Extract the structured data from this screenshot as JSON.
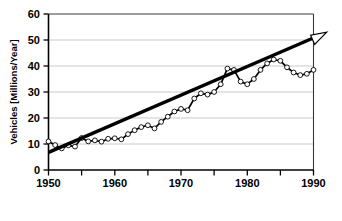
{
  "chart_data": {
    "type": "line",
    "title": "",
    "xlabel": "",
    "ylabel": "Vehicles [Millions/Year]",
    "xlim": [
      1950,
      1990
    ],
    "ylim": [
      0,
      60
    ],
    "grid": true,
    "legend_position": "none",
    "x_ticks_major": [
      1950,
      1960,
      1970,
      1980,
      1990
    ],
    "x_ticks_minor": [
      1955,
      1965,
      1975,
      1985
    ],
    "x_tick_labels": [
      "1950",
      "1960",
      "1970",
      "1980",
      "1990"
    ],
    "y_ticks": [
      0,
      10,
      20,
      30,
      40,
      50,
      60
    ],
    "y_tick_labels": [
      "0",
      "10",
      "20",
      "30",
      "40",
      "50",
      "60"
    ],
    "series": [
      {
        "name": "Vehicles produced",
        "style": "line-with-open-markers",
        "color": "#000000",
        "marker": "open-circle",
        "x": [
          1950,
          1951,
          1952,
          1953,
          1954,
          1955,
          1956,
          1957,
          1958,
          1959,
          1960,
          1961,
          1962,
          1963,
          1964,
          1965,
          1966,
          1967,
          1968,
          1969,
          1970,
          1971,
          1972,
          1973,
          1974,
          1975,
          1976,
          1977,
          1978,
          1979,
          1980,
          1981,
          1982,
          1983,
          1984,
          1985,
          1986,
          1987,
          1988,
          1989,
          1990
        ],
        "values": [
          11.0,
          9.6,
          8.3,
          9.5,
          9.0,
          12.3,
          11.0,
          11.4,
          10.9,
          12.0,
          12.2,
          11.8,
          13.8,
          15.3,
          16.5,
          17.2,
          16.0,
          18.5,
          20.5,
          22.5,
          23.5,
          23.0,
          27.5,
          29.5,
          29.0,
          30.0,
          33.0,
          39.0,
          38.5,
          34.0,
          33.0,
          35.0,
          38.5,
          41.0,
          42.5,
          42.0,
          39.5,
          37.5,
          36.5,
          37.0,
          38.5
        ]
      },
      {
        "name": "Linear trend",
        "style": "thick-straight-line-with-arrow",
        "color": "#000000",
        "x": [
          1950,
          1992
        ],
        "values": [
          6.8,
          53.0
        ],
        "arrow_at_end": true
      }
    ],
    "annotations": []
  },
  "axes": {
    "y_axis_title": "Vehicles [Millions/Year]",
    "x_tick_labels": [
      "1950",
      "1960",
      "1970",
      "1980",
      "1990"
    ],
    "y_tick_labels": [
      "0",
      "10",
      "20",
      "30",
      "40",
      "50",
      "60"
    ]
  },
  "colors": {
    "foreground": "#000000",
    "gridline": "#c9c9c9",
    "background": "#ffffff",
    "marker_fill": "#ffffff"
  }
}
